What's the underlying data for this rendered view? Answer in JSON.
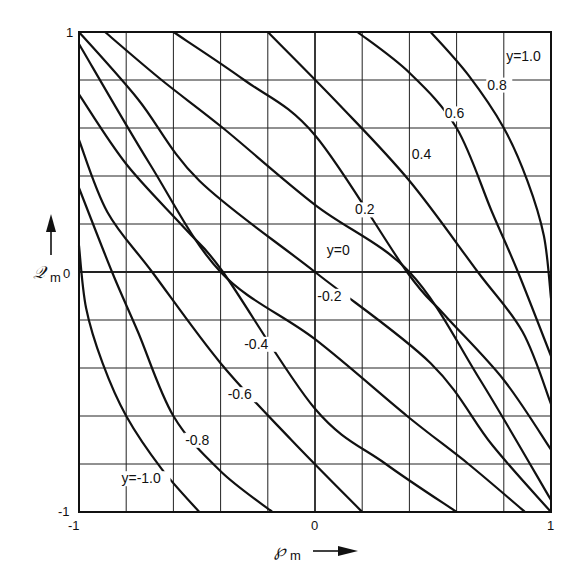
{
  "chart_data": {
    "type": "line",
    "title": "",
    "xlabel": "Pm",
    "ylabel": "Qm",
    "xlim": [
      -1,
      1
    ],
    "ylim": [
      -1,
      1
    ],
    "grid": true,
    "grid_divisions": 10,
    "legend": "none (curves labeled inline)",
    "x_ticks": [
      "-1",
      "0",
      "1"
    ],
    "y_ticks": [
      "-1",
      "0",
      "1"
    ],
    "series": [
      {
        "name": "y=-1.0",
        "label": "y=-1.0",
        "points": [
          [
            -1.0,
            0.11
          ],
          [
            -0.97,
            -0.15
          ],
          [
            -0.9,
            -0.38
          ],
          [
            -0.8,
            -0.6
          ],
          [
            -0.65,
            -0.82
          ],
          [
            -0.49,
            -1.0
          ]
        ]
      },
      {
        "name": "y=-0.8",
        "label": "-0.8",
        "points": [
          [
            -1.0,
            0.35
          ],
          [
            -0.86,
            0.0
          ],
          [
            -0.75,
            -0.25
          ],
          [
            -0.6,
            -0.6
          ],
          [
            -0.4,
            -0.83
          ],
          [
            -0.18,
            -1.0
          ]
        ]
      },
      {
        "name": "y=-0.6",
        "label": "-0.6",
        "points": [
          [
            -1.0,
            0.55
          ],
          [
            -0.88,
            0.25
          ],
          [
            -0.69,
            0.0
          ],
          [
            -0.4,
            -0.38
          ],
          [
            -0.1,
            -0.7
          ],
          [
            0.2,
            -1.0
          ]
        ]
      },
      {
        "name": "y=-0.4",
        "label": "-0.4",
        "points": [
          [
            -1.0,
            0.74
          ],
          [
            -0.8,
            0.45
          ],
          [
            -0.55,
            0.18
          ],
          [
            -0.39,
            0.0
          ],
          [
            0.0,
            -0.57
          ],
          [
            0.3,
            -0.8
          ],
          [
            0.6,
            -1.0
          ]
        ]
      },
      {
        "name": "y=-0.2",
        "label": "-0.2",
        "points": [
          [
            -1.0,
            0.95
          ],
          [
            -0.7,
            0.45
          ],
          [
            -0.4,
            0.0
          ],
          [
            0.0,
            -0.28
          ],
          [
            0.39,
            -0.6
          ],
          [
            0.65,
            -0.8
          ],
          [
            0.89,
            -1.0
          ]
        ]
      },
      {
        "name": "y=0",
        "label": "y=0",
        "points": [
          [
            -1.0,
            1.0
          ],
          [
            -0.75,
            0.72
          ],
          [
            -0.49,
            0.38
          ],
          [
            0.0,
            0.0
          ],
          [
            0.49,
            -0.38
          ],
          [
            0.75,
            -0.72
          ],
          [
            1.0,
            -1.0
          ]
        ]
      },
      {
        "name": "y=0.2",
        "label": "0.2",
        "points": [
          [
            -0.89,
            1.0
          ],
          [
            -0.65,
            0.8
          ],
          [
            -0.39,
            0.6
          ],
          [
            0.0,
            0.28
          ],
          [
            0.4,
            0.0
          ],
          [
            0.7,
            -0.45
          ],
          [
            1.0,
            -0.95
          ]
        ]
      },
      {
        "name": "y=0.4",
        "label": "0.4",
        "points": [
          [
            -0.6,
            1.0
          ],
          [
            -0.3,
            0.8
          ],
          [
            0.0,
            0.57
          ],
          [
            0.39,
            0.0
          ],
          [
            0.55,
            -0.18
          ],
          [
            0.8,
            -0.45
          ],
          [
            1.0,
            -0.74
          ]
        ]
      },
      {
        "name": "y=0.6",
        "label": "0.6",
        "points": [
          [
            -0.2,
            1.0
          ],
          [
            0.1,
            0.7
          ],
          [
            0.4,
            0.38
          ],
          [
            0.69,
            0.0
          ],
          [
            0.88,
            -0.25
          ],
          [
            1.0,
            -0.55
          ]
        ]
      },
      {
        "name": "y=0.8",
        "label": "0.8",
        "points": [
          [
            0.18,
            1.0
          ],
          [
            0.4,
            0.83
          ],
          [
            0.6,
            0.6
          ],
          [
            0.75,
            0.25
          ],
          [
            0.86,
            0.0
          ],
          [
            1.0,
            -0.35
          ]
        ]
      },
      {
        "name": "y=1.0",
        "label": "y=1.0",
        "points": [
          [
            0.49,
            1.0
          ],
          [
            0.65,
            0.82
          ],
          [
            0.8,
            0.6
          ],
          [
            0.9,
            0.38
          ],
          [
            0.97,
            0.15
          ],
          [
            1.0,
            -0.11
          ]
        ]
      }
    ],
    "curve_label_positions": [
      {
        "label": "y=-1.0",
        "x": -0.82,
        "y": -0.88
      },
      {
        "label": "-0.8",
        "x": -0.55,
        "y": -0.72
      },
      {
        "label": "-0.6",
        "x": -0.37,
        "y": -0.53
      },
      {
        "label": "-0.4",
        "x": -0.3,
        "y": -0.32
      },
      {
        "label": "-0.2",
        "x": 0.01,
        "y": -0.12
      },
      {
        "label": "y=0",
        "x": 0.05,
        "y": 0.07
      },
      {
        "label": "0.2",
        "x": 0.17,
        "y": 0.24
      },
      {
        "label": "0.4",
        "x": 0.41,
        "y": 0.47
      },
      {
        "label": "0.6",
        "x": 0.55,
        "y": 0.64
      },
      {
        "label": "0.8",
        "x": 0.73,
        "y": 0.76
      },
      {
        "label": "y=1.0",
        "x": 0.81,
        "y": 0.88
      }
    ]
  },
  "axes": {
    "x_title": "℘",
    "x_sub": "m",
    "y_title": "𝒬",
    "y_sub": "m",
    "x_tick_left": "-1",
    "x_tick_mid": "0",
    "x_tick_right": "1",
    "y_tick_top": "1",
    "y_tick_mid": "0",
    "y_tick_bottom": "-1"
  }
}
